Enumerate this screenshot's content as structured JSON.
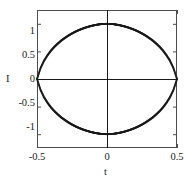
{
  "chart_data": {
    "type": "scatter",
    "title": "",
    "xlabel": "t",
    "ylabel": "I",
    "xlim": [
      -0.5,
      0.5
    ],
    "ylim": [
      -1.25,
      1.25
    ],
    "xticks": [
      -0.5,
      0,
      0.5
    ],
    "xticklabels": [
      "-0.5",
      "0",
      "0.5"
    ],
    "yticks": [
      -1,
      -0.5,
      0,
      0.5,
      1
    ],
    "yticklabels": [
      "-1",
      "-0.5",
      "0",
      "0.5",
      "1"
    ],
    "grid": false,
    "legend": null,
    "marker": "dot",
    "marker_color": "#1a1a1a",
    "axis_lines_at_zero": true,
    "series": [
      {
        "name": "upper-branch",
        "values": [
          {
            "x": -0.5,
            "y": 0.0
          },
          {
            "x": -0.475,
            "y": 0.195
          },
          {
            "x": -0.45,
            "y": 0.33
          },
          {
            "x": -0.425,
            "y": 0.43
          },
          {
            "x": -0.4,
            "y": 0.515
          },
          {
            "x": -0.375,
            "y": 0.585
          },
          {
            "x": -0.35,
            "y": 0.645
          },
          {
            "x": -0.325,
            "y": 0.7
          },
          {
            "x": -0.3,
            "y": 0.745
          },
          {
            "x": -0.275,
            "y": 0.788
          },
          {
            "x": -0.25,
            "y": 0.825
          },
          {
            "x": -0.225,
            "y": 0.858
          },
          {
            "x": -0.2,
            "y": 0.887
          },
          {
            "x": -0.175,
            "y": 0.912
          },
          {
            "x": -0.15,
            "y": 0.934
          },
          {
            "x": -0.125,
            "y": 0.953
          },
          {
            "x": -0.1,
            "y": 0.969
          },
          {
            "x": -0.075,
            "y": 0.982
          },
          {
            "x": -0.05,
            "y": 0.992
          },
          {
            "x": -0.025,
            "y": 0.998
          },
          {
            "x": 0.0,
            "y": 1.0
          },
          {
            "x": 0.025,
            "y": 0.998
          },
          {
            "x": 0.05,
            "y": 0.992
          },
          {
            "x": 0.075,
            "y": 0.982
          },
          {
            "x": 0.1,
            "y": 0.969
          },
          {
            "x": 0.125,
            "y": 0.953
          },
          {
            "x": 0.15,
            "y": 0.934
          },
          {
            "x": 0.175,
            "y": 0.912
          },
          {
            "x": 0.2,
            "y": 0.887
          },
          {
            "x": 0.225,
            "y": 0.858
          },
          {
            "x": 0.25,
            "y": 0.825
          },
          {
            "x": 0.275,
            "y": 0.788
          },
          {
            "x": 0.3,
            "y": 0.745
          },
          {
            "x": 0.325,
            "y": 0.7
          },
          {
            "x": 0.35,
            "y": 0.645
          },
          {
            "x": 0.375,
            "y": 0.585
          },
          {
            "x": 0.4,
            "y": 0.515
          },
          {
            "x": 0.425,
            "y": 0.43
          },
          {
            "x": 0.45,
            "y": 0.33
          },
          {
            "x": 0.475,
            "y": 0.195
          },
          {
            "x": 0.5,
            "y": 0.0
          }
        ]
      },
      {
        "name": "lower-branch",
        "values": [
          {
            "x": -0.5,
            "y": 0.0
          },
          {
            "x": -0.475,
            "y": -0.195
          },
          {
            "x": -0.45,
            "y": -0.33
          },
          {
            "x": -0.425,
            "y": -0.43
          },
          {
            "x": -0.4,
            "y": -0.515
          },
          {
            "x": -0.375,
            "y": -0.585
          },
          {
            "x": -0.35,
            "y": -0.645
          },
          {
            "x": -0.325,
            "y": -0.7
          },
          {
            "x": -0.3,
            "y": -0.745
          },
          {
            "x": -0.275,
            "y": -0.788
          },
          {
            "x": -0.25,
            "y": -0.825
          },
          {
            "x": -0.225,
            "y": -0.858
          },
          {
            "x": -0.2,
            "y": -0.887
          },
          {
            "x": -0.175,
            "y": -0.912
          },
          {
            "x": -0.15,
            "y": -0.934
          },
          {
            "x": -0.125,
            "y": -0.953
          },
          {
            "x": -0.1,
            "y": -0.969
          },
          {
            "x": -0.075,
            "y": -0.982
          },
          {
            "x": -0.05,
            "y": -0.992
          },
          {
            "x": -0.025,
            "y": -0.998
          },
          {
            "x": 0.0,
            "y": -1.0
          },
          {
            "x": 0.025,
            "y": -0.998
          },
          {
            "x": 0.05,
            "y": -0.992
          },
          {
            "x": 0.075,
            "y": -0.982
          },
          {
            "x": 0.1,
            "y": -0.969
          },
          {
            "x": 0.125,
            "y": -0.953
          },
          {
            "x": 0.15,
            "y": -0.934
          },
          {
            "x": 0.175,
            "y": -0.912
          },
          {
            "x": 0.2,
            "y": -0.887
          },
          {
            "x": 0.225,
            "y": -0.858
          },
          {
            "x": 0.25,
            "y": -0.825
          },
          {
            "x": 0.275,
            "y": -0.788
          },
          {
            "x": 0.3,
            "y": -0.745
          },
          {
            "x": 0.325,
            "y": -0.7
          },
          {
            "x": 0.35,
            "y": -0.645
          },
          {
            "x": 0.375,
            "y": -0.585
          },
          {
            "x": 0.4,
            "y": -0.515
          },
          {
            "x": 0.425,
            "y": -0.43
          },
          {
            "x": 0.45,
            "y": -0.33
          },
          {
            "x": 0.475,
            "y": -0.195
          },
          {
            "x": 0.5,
            "y": 0.0
          }
        ]
      }
    ]
  },
  "geometry": {
    "plot_left": 37,
    "plot_right": 177,
    "plot_top": 10,
    "plot_bottom": 148,
    "frame_color": "#4d4d4d",
    "axis_color": "#1a1a1a"
  },
  "labels": {
    "ytick_1": "1",
    "ytick_05": "0.5",
    "ytick_0": "0",
    "ytick_m05": "-0.5",
    "ytick_m1": "-1",
    "xtick_m05": "-0.5",
    "xtick_0": "0",
    "xtick_05": "0.5",
    "xaxis_title": "t",
    "yaxis_title": "I"
  }
}
